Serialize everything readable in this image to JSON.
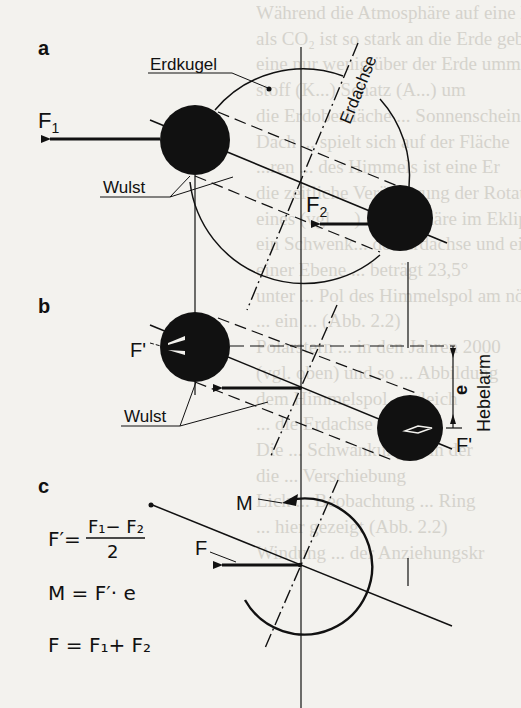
{
  "figure": {
    "panels": [
      {
        "id": "a",
        "label": "a",
        "annotations": {
          "earth": "Erdkugel",
          "axis": "Erdachse",
          "bulge": "Wulst",
          "force1": "F",
          "force1_sub": "1",
          "force2": "F",
          "force2_sub": "2"
        }
      },
      {
        "id": "b",
        "label": "b",
        "annotations": {
          "force_prime_left": "F'",
          "force_prime_right": "F'",
          "bulge": "Wulst",
          "lever_symbol": "e",
          "lever_arm": "Hebelarm"
        }
      },
      {
        "id": "c",
        "label": "c",
        "annotations": {
          "moment": "M",
          "force": "F"
        },
        "equations": {
          "eq1_lhs": "F′=",
          "eq1_num": "F₁− F₂",
          "eq1_den": "2",
          "eq2": "M = F′· e",
          "eq3": "F = F₁+ F₂"
        }
      }
    ],
    "colors": {
      "ink": "#111111",
      "paper": "#f3f2ee",
      "bleed_text": "#bdbab2"
    }
  },
  "bleed_through": [
    "Während die Atmosphäre auf eine Na",
    "als CO₂ ist so stark an die Erde gebunde",
    "eine nur wenig über der Erde umm",
    "stoff (K...) Schatz (A...) um",
    "die Erdoberfläche ... Sonnenschein",
    "Dach ... spielt sich auf der Fläche",
    "...ren ... des Himmels ist eine Er",
    "die zeitliche Veränderung der Rotation",
    "eines (vgl. ...) Atmosphäre im Ekliptik",
    "ein Schwenk... der Erdachse und ein",
    "einer Ebene ... beträgt 23,5°",
    "unter ... Pol des Himmelspol am nördl",
    "... ein ... (Abb. 2.2)",
    "Polarstern ... in den Jahren 2000",
    "(vgl. oben) und so ... Abbildung",
    "dem Himmelspol ... gleich",
    "... die Erdachse",
    "Die ... Schwankung ... in der",
    "die ... Verschiebung",
    "Lick ... Beobachtung ... Ring",
    "... hier gezeigt (Abb. 2.2)",
    "Windung ... der Anziehungskr"
  ]
}
